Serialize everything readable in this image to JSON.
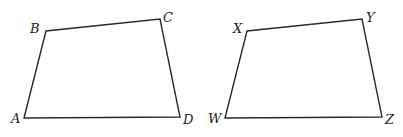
{
  "figures": [
    {
      "name": "ABCD",
      "vertices": [
        {
          "label": "A",
          "x": 24,
          "y": 118,
          "lx": 11,
          "ly": 123
        },
        {
          "label": "B",
          "x": 46,
          "y": 31,
          "lx": 30,
          "ly": 33
        },
        {
          "label": "C",
          "x": 160,
          "y": 19,
          "lx": 163,
          "ly": 22
        },
        {
          "label": "D",
          "x": 180,
          "y": 117,
          "lx": 183,
          "ly": 124
        }
      ]
    },
    {
      "name": "WXYZ",
      "vertices": [
        {
          "label": "W",
          "x": 225,
          "y": 118,
          "lx": 208,
          "ly": 123
        },
        {
          "label": "X",
          "x": 247,
          "y": 31,
          "lx": 233,
          "ly": 33
        },
        {
          "label": "Y",
          "x": 362,
          "y": 19,
          "lx": 366,
          "ly": 22
        },
        {
          "label": "Z",
          "x": 382,
          "y": 117,
          "lx": 385,
          "ly": 124
        }
      ]
    }
  ],
  "style": {
    "stroke_color": "#2a2a2a",
    "label_color": "#1e1e1e",
    "background": "#ffffff"
  }
}
